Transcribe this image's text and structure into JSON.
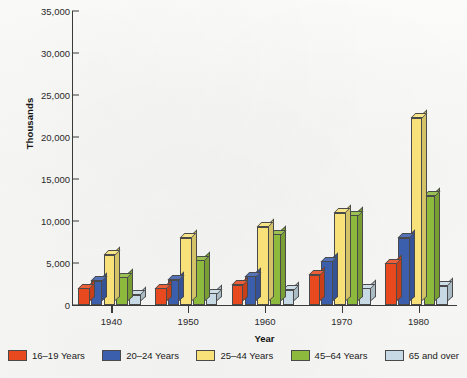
{
  "chart_data": {
    "type": "bar",
    "title": "",
    "xlabel": "Year",
    "ylabel": "Thousands",
    "categories": [
      "1940",
      "1950",
      "1960",
      "1970",
      "1980"
    ],
    "ylim": [
      0,
      35000
    ],
    "ytick_values": [
      0,
      5000,
      10000,
      15000,
      20000,
      25000,
      30000,
      35000
    ],
    "ytick_labels": [
      "0",
      "5,000",
      "10,000",
      "15,000",
      "20,000",
      "25,000",
      "30,000",
      "35,000"
    ],
    "grid": false,
    "legend_position": "bottom",
    "series": [
      {
        "name": "16–19 Years",
        "color": "#E8491E",
        "values": [
          2000,
          2000,
          2400,
          3600,
          5000
        ]
      },
      {
        "name": "20–24 Years",
        "color": "#3C5FAD",
        "values": [
          2900,
          3000,
          3400,
          5200,
          8000
        ]
      },
      {
        "name": "25–44 Years",
        "color": "#F7E178",
        "values": [
          6000,
          8000,
          9300,
          11000,
          22300
        ]
      },
      {
        "name": "45–64 Years",
        "color": "#8DB93C",
        "values": [
          3300,
          5300,
          8400,
          10700,
          13000
        ]
      },
      {
        "name": "65 and over",
        "color": "#C6D9E4",
        "values": [
          1200,
          1400,
          1800,
          2000,
          2300
        ]
      }
    ]
  }
}
